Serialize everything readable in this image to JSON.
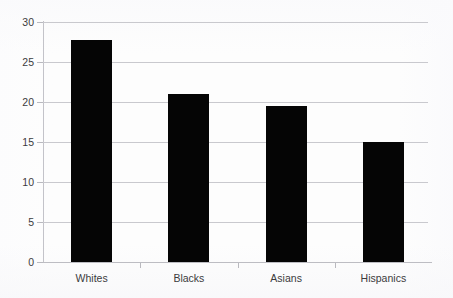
{
  "chart_data": {
    "type": "bar",
    "title": "",
    "subtitle": "",
    "xlabel": "",
    "ylabel": "",
    "categories": [
      "Whites",
      "Blacks",
      "Asians",
      "Hispanics"
    ],
    "values": [
      27.8,
      21.0,
      19.5,
      15.0
    ],
    "ylim": [
      0,
      30
    ],
    "ytick_labels": [
      "0",
      "5",
      "10",
      "15",
      "20",
      "25",
      "30"
    ],
    "ytick_values": [
      0,
      5,
      10,
      15,
      20,
      25,
      30
    ],
    "grid": true,
    "legend": false,
    "legend_position": "none",
    "bar_color": "#050505",
    "gridline_color": "#c9c9ce",
    "axis_color": "#c3c3c9",
    "text_color": "#3b3b3d",
    "background_color": "#fdfdfd",
    "annotations": []
  }
}
